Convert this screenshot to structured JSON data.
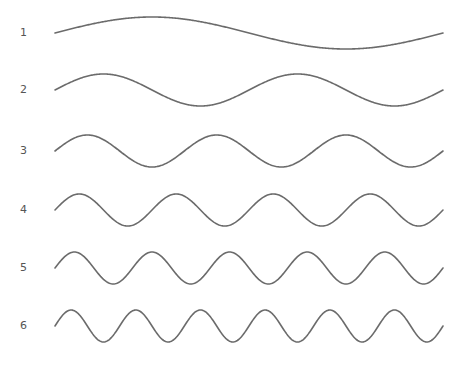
{
  "diagram": {
    "title": "",
    "stroke_color": "#6b6b6b",
    "background": "#ffffff",
    "x_start": 55,
    "x_end": 443,
    "amplitude": 16,
    "waves": [
      {
        "label": "1",
        "cycles": 1,
        "center_y": 33
      },
      {
        "label": "2",
        "cycles": 2,
        "center_y": 90
      },
      {
        "label": "3",
        "cycles": 3,
        "center_y": 151
      },
      {
        "label": "4",
        "cycles": 4,
        "center_y": 210
      },
      {
        "label": "5",
        "cycles": 5,
        "center_y": 268
      },
      {
        "label": "6",
        "cycles": 6,
        "center_y": 326
      }
    ]
  }
}
